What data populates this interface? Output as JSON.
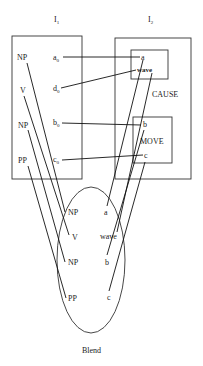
{
  "title_left": {
    "base": "I",
    "sub": "1"
  },
  "title_right": {
    "base": "I",
    "sub": "2"
  },
  "input1": {
    "roles": [
      "NP",
      "V",
      "NP",
      "PP"
    ],
    "elements": [
      {
        "base": "a",
        "sub": "0"
      },
      {
        "base": "d",
        "sub": "0"
      },
      {
        "base": "b",
        "sub": "0"
      },
      {
        "base": "c",
        "sub": "0"
      }
    ]
  },
  "input2": {
    "frame_label": "CAUSE",
    "cause_box_items": [
      "a",
      "wave"
    ],
    "move_box_label": "MOVE",
    "move_box_items": [
      "b",
      "c"
    ]
  },
  "blend": {
    "label": "Blend",
    "left_column": [
      "NP",
      "V",
      "NP",
      "PP"
    ],
    "right_column": [
      "a",
      "wave",
      "b",
      "c"
    ]
  },
  "colors": {
    "stroke": "#111111",
    "text": "#222222",
    "background": "#ffffff"
  }
}
